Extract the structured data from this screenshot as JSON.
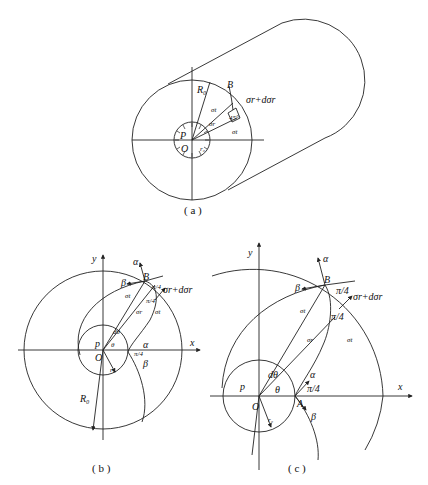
{
  "figures": {
    "a": {
      "caption": "( a )",
      "labels": {
        "R0": "R₀",
        "B": "B",
        "sigma_r_d": "σr+dσr",
        "sigma_t_top": "σt",
        "sigma_t": "σt",
        "sigma_r": "σr",
        "angle45": "45°",
        "P": "P",
        "O": "O",
        "r0": "r₀"
      }
    },
    "b": {
      "caption": "( b )",
      "labels": {
        "y": "y",
        "x": "x",
        "alpha_top": "α",
        "beta_top": "β",
        "B": "B",
        "pi4_top": "π/4",
        "sigma_r_d": "σr+dσr",
        "sigma_t_left": "σt",
        "pi4_mid": "π/4",
        "sigma_r": "σr",
        "sigma_t_right": "σt",
        "dtheta": "dθ",
        "theta": "θ",
        "p": "p",
        "O": "O",
        "r0": "r₀",
        "alpha_A": "α",
        "pi4_A": "π/4",
        "beta_A": "β",
        "R0": "R₀"
      }
    },
    "c": {
      "caption": "( c )",
      "labels": {
        "y": "y",
        "x": "x",
        "alpha_top": "α",
        "beta_top": "β",
        "B": "B",
        "pi4_top": "π/4",
        "sigma_r_d": "σr+dσr",
        "sigma_t_left": "σt",
        "pi4_mid": "π/4",
        "sigma_r": "σr",
        "sigma_t_right": "σt",
        "dtheta": "dθ",
        "theta": "θ",
        "p": "p",
        "O": "O",
        "r0": "r₀",
        "A": "A",
        "alpha_A": "α",
        "pi4_A": "π/4",
        "beta_A": "β"
      }
    }
  }
}
